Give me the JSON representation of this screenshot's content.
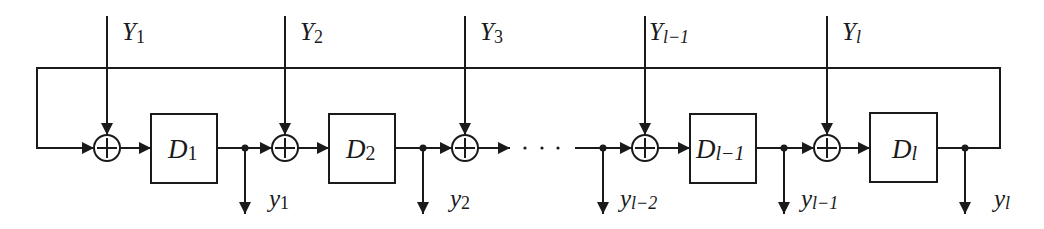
{
  "diagram": {
    "colors": {
      "stroke": "#1a1a1a",
      "background": "#ffffff"
    },
    "inputs": [
      {
        "var": "Y",
        "sub": "1"
      },
      {
        "var": "Y",
        "sub": "2"
      },
      {
        "var": "Y",
        "sub": "3"
      },
      {
        "var": "Y",
        "sub": "l−1"
      },
      {
        "var": "Y",
        "sub": "l"
      }
    ],
    "delays": [
      {
        "var": "D",
        "sub": "1"
      },
      {
        "var": "D",
        "sub": "2"
      },
      {
        "var": "D",
        "sub": "l−1"
      },
      {
        "var": "D",
        "sub": "l"
      }
    ],
    "outputs": [
      {
        "var": "y",
        "sub": "1"
      },
      {
        "var": "y",
        "sub": "2"
      },
      {
        "var": "y",
        "sub": "l−2"
      },
      {
        "var": "y",
        "sub": "l−1"
      },
      {
        "var": "y",
        "sub": "l"
      }
    ],
    "ellipsis": "· · ·",
    "adder_symbol": "plus-in-circle"
  }
}
